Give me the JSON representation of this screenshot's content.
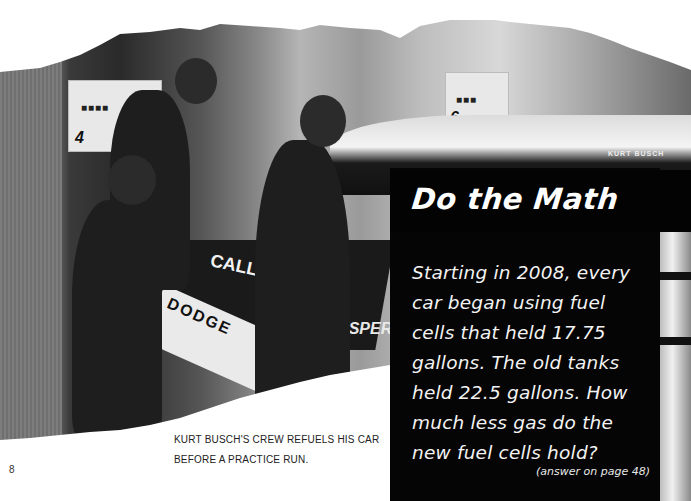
{
  "page": {
    "number": "8"
  },
  "photo": {
    "description": "Kurt Busch's pit crew refueling race car",
    "signs": [
      {
        "number": "4"
      },
      {
        "number": "6"
      }
    ],
    "car_text": {
      "sponsor": "CALL",
      "make": "DODGE",
      "side": "YSPER",
      "driver_name": "KURT BUSCH"
    }
  },
  "sidebar": {
    "title": "Do the Math",
    "body": "Starting in 2008, every car began using fuel cells that held 17.75 gallons. The old tanks held 22.5 gallons. How much less gas do the new fuel cells hold?",
    "lines": [
      "Starting in 2008, every",
      "car began using fuel",
      "cells that held 17.75",
      "gallons. The old tanks",
      "held 22.5 gallons. How",
      "much less gas do the",
      "new fuel cells hold?"
    ],
    "answer_note": "(answer on page 48)"
  },
  "caption": {
    "lines": [
      "KURT BUSCH'S CREW REFUELS HIS CAR",
      "BEFORE A PRACTICE RUN."
    ]
  },
  "colors": {
    "box_background": "#050505",
    "box_text": "#ffffff",
    "page_background": "#ffffff",
    "caption_text": "#222222"
  }
}
